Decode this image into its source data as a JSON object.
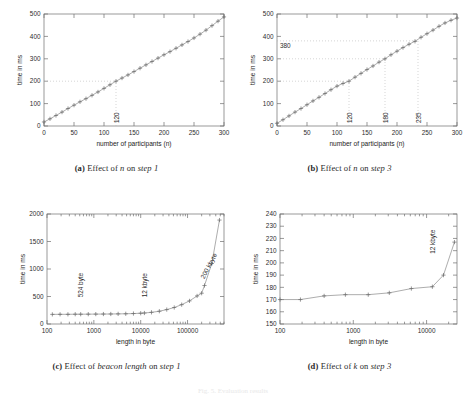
{
  "figure": {
    "bottom_note": "Fig. 5. Evaluation results"
  },
  "panels": [
    {
      "key": "a",
      "caption_label": "(a)",
      "caption_pre": "Effect of",
      "caption_it1": "n",
      "caption_mid": "on",
      "caption_it2": "step 1"
    },
    {
      "key": "b",
      "caption_label": "(b)",
      "caption_pre": "Effect of",
      "caption_it1": "n",
      "caption_mid": "on",
      "caption_it2": "step 3"
    },
    {
      "key": "c",
      "caption_label": "(c)",
      "caption_pre": "Effect of",
      "caption_it1": "beacon length",
      "caption_mid": "on",
      "caption_it2": "step 1"
    },
    {
      "key": "d",
      "caption_label": "(d)",
      "caption_pre": "Effect of",
      "caption_it1": "k",
      "caption_mid": "on",
      "caption_it2": "step 3"
    }
  ],
  "chart_data": [
    {
      "id": "a",
      "type": "line",
      "title": "Effect of n on step 1",
      "xlabel": "number of participants (n)",
      "ylabel": "time in ms",
      "xscale": "linear",
      "yscale": "linear",
      "xlim": [
        0,
        300
      ],
      "ylim": [
        0,
        500
      ],
      "xticks": [
        0,
        50,
        100,
        150,
        200,
        250,
        300
      ],
      "yticks": [
        0,
        100,
        200,
        300,
        400,
        500
      ],
      "grid": false,
      "legend": "none",
      "marker": "+",
      "x": [
        0,
        10,
        20,
        30,
        40,
        50,
        60,
        70,
        80,
        90,
        100,
        110,
        120,
        130,
        140,
        150,
        160,
        170,
        180,
        190,
        200,
        210,
        220,
        230,
        240,
        250,
        260,
        270,
        280,
        290,
        300
      ],
      "y": [
        18,
        32,
        47,
        62,
        78,
        93,
        108,
        122,
        137,
        152,
        168,
        184,
        200,
        214,
        228,
        243,
        258,
        273,
        288,
        303,
        318,
        332,
        347,
        362,
        377,
        393,
        410,
        428,
        448,
        468,
        487
      ],
      "annotations": [
        {
          "text": "120",
          "x": 120,
          "y": 0,
          "rotation": -90,
          "guide": "crosshair",
          "guide_y": 200
        }
      ]
    },
    {
      "id": "b",
      "type": "line",
      "title": "Effect of n on step 3",
      "xlabel": "number of participants (n)",
      "ylabel": "time in ms",
      "xscale": "linear",
      "yscale": "linear",
      "xlim": [
        0,
        300
      ],
      "ylim": [
        0,
        500
      ],
      "xticks": [
        0,
        50,
        100,
        150,
        200,
        250,
        300
      ],
      "yticks": [
        0,
        100,
        200,
        300,
        400,
        500
      ],
      "grid": false,
      "legend": "none",
      "marker": "+",
      "x": [
        0,
        10,
        20,
        30,
        40,
        50,
        60,
        70,
        80,
        90,
        100,
        110,
        120,
        130,
        140,
        150,
        160,
        170,
        180,
        190,
        200,
        210,
        220,
        230,
        240,
        250,
        260,
        270,
        280,
        290,
        300
      ],
      "y": [
        12,
        28,
        45,
        62,
        78,
        95,
        112,
        128,
        145,
        162,
        178,
        190,
        200,
        218,
        235,
        252,
        268,
        285,
        300,
        318,
        334,
        350,
        365,
        378,
        396,
        412,
        428,
        445,
        460,
        472,
        482
      ],
      "annotations": [
        {
          "text": "120",
          "x": 120,
          "y": 0,
          "rotation": -90,
          "guide": "crosshair",
          "guide_y": 200
        },
        {
          "text": "180",
          "x": 180,
          "y": 0,
          "rotation": -90,
          "guide": "crosshair",
          "guide_y": 300
        },
        {
          "text": "235",
          "x": 235,
          "y": 0,
          "rotation": -90,
          "guide": "crosshair",
          "guide_y": 380
        },
        {
          "text": "380",
          "x": 0,
          "y": 380,
          "rotation": 0,
          "guide": "none"
        }
      ]
    },
    {
      "id": "c",
      "type": "line",
      "title": "Effect of beacon length on step 1",
      "xlabel": "length in byte",
      "ylabel": "time in ms",
      "xscale": "log",
      "yscale": "linear",
      "xlim": [
        100,
        600000
      ],
      "ylim": [
        0,
        2000
      ],
      "xticks": [
        100,
        1000,
        10000,
        100000
      ],
      "yticks": [
        0,
        500,
        1000,
        1500,
        2000
      ],
      "grid": false,
      "legend": "none",
      "marker": "+",
      "x": [
        130,
        190,
        280,
        400,
        524,
        760,
        1100,
        1600,
        2300,
        3300,
        4800,
        7000,
        10000,
        12000,
        17000,
        25000,
        36000,
        52000,
        75000,
        110000,
        160000,
        200000,
        230000,
        330000,
        480000
      ],
      "y": [
        175,
        176,
        176,
        178,
        178,
        179,
        180,
        181,
        182,
        184,
        186,
        190,
        196,
        200,
        212,
        232,
        262,
        300,
        352,
        420,
        510,
        560,
        700,
        1100,
        1890
      ],
      "annotations": [
        {
          "text": "524 byte",
          "x": 524,
          "y": 430,
          "rotation": -90,
          "guide": "none"
        },
        {
          "text": "12 kbyte",
          "x": 12000,
          "y": 430,
          "rotation": -90,
          "guide": "none"
        },
        {
          "text": "200 kbyte",
          "x": 200000,
          "y": 760,
          "rotation": -62,
          "guide": "none"
        }
      ]
    },
    {
      "id": "d",
      "type": "line",
      "title": "Effect of k on step 3",
      "xlabel": "length in byte",
      "ylabel": "time in ms",
      "xscale": "log",
      "yscale": "linear",
      "xlim": [
        100,
        26000
      ],
      "ylim": [
        150,
        240
      ],
      "xticks": [
        100,
        1000,
        10000
      ],
      "yticks": [
        150,
        160,
        170,
        180,
        190,
        200,
        210,
        220,
        230,
        240
      ],
      "grid": false,
      "legend": "none",
      "marker": "+",
      "x": [
        100,
        190,
        400,
        780,
        1600,
        3100,
        6200,
        12000,
        17000,
        24000
      ],
      "y": [
        170,
        170,
        173,
        174,
        174,
        175.5,
        179,
        180.5,
        190,
        217
      ],
      "annotations": [
        {
          "text": "12 kbyte",
          "x": 12000,
          "y": 205,
          "rotation": -90,
          "guide": "none"
        }
      ]
    }
  ]
}
